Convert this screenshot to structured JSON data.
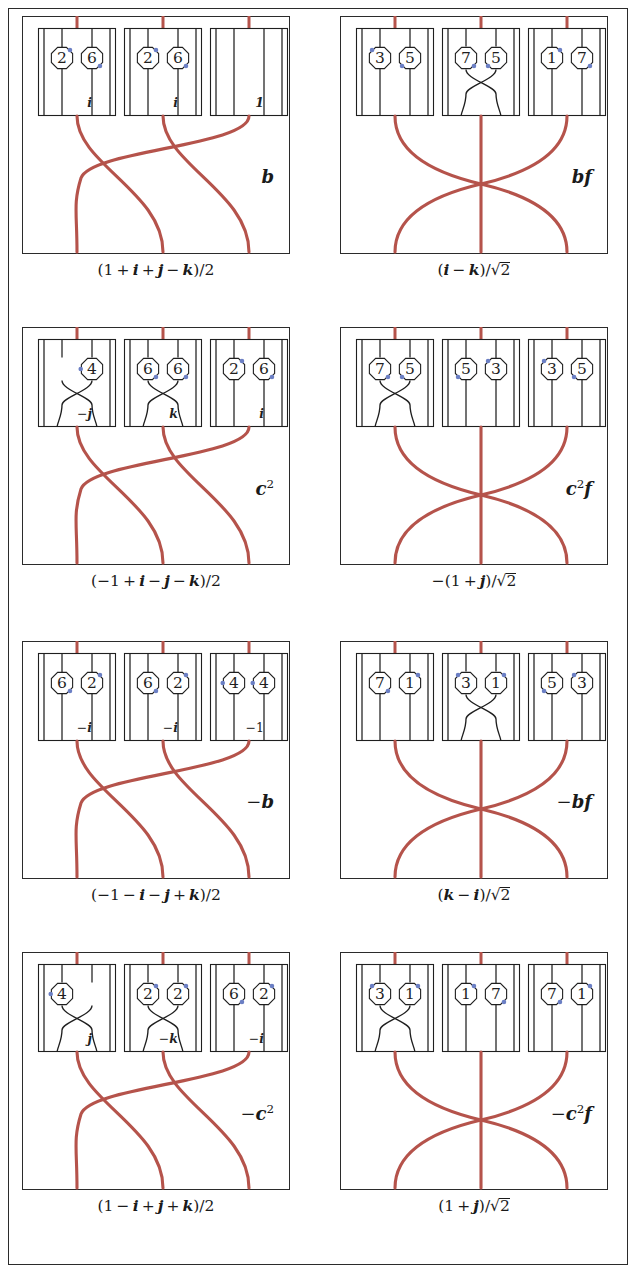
{
  "figure": {
    "type": "braid-diagram-grid",
    "rows": 4,
    "cols": 2,
    "colors": {
      "strand_red": "#b5534b",
      "ink_black": "#1f1f1f",
      "dot_blue": "#6b7fc4",
      "frame": "#2b2b2b",
      "background": "#ffffff"
    },
    "braid_patterns": {
      "left_column": "cyclic-3-strand (1->2, 2->3, 3->1) with two crossings",
      "right_column": "outer-swap (1<->3) crossing at center, middle strand straight"
    }
  },
  "panels": [
    {
      "id": "panel-1",
      "row": 0,
      "col": 0,
      "tag": "b",
      "tag_html": "<span class=\"mi\">b</span>",
      "caption": "(1 + i + j - k)/2",
      "caption_html": "<span class=\"mn\">(1&#8201;+&#8201;</span><span class=\"mi\">i</span><span class=\"mn\">&#8201;+&#8201;</span><span class=\"mi\">j</span><span class=\"mn\">&#8201;&#8722;&#8201;</span><span class=\"mi\">k</span><span class=\"mn\">)/2</span>",
      "braid": "left",
      "cells": [
        {
          "label": "i",
          "crossing": false,
          "nodes": [
            {
              "strand": 0,
              "value": "2",
              "dot": "top-right"
            },
            {
              "strand": 1,
              "value": "6",
              "dot": "bottom-right"
            }
          ]
        },
        {
          "label": "i",
          "crossing": false,
          "nodes": [
            {
              "strand": 0,
              "value": "2",
              "dot": "top-right"
            },
            {
              "strand": 1,
              "value": "6",
              "dot": "bottom-right"
            }
          ]
        },
        {
          "label": "1",
          "crossing": false,
          "nodes": []
        }
      ]
    },
    {
      "id": "panel-2",
      "row": 0,
      "col": 1,
      "tag": "bf",
      "tag_html": "<span class=\"mi\">bf</span>",
      "caption": "(i - k)/√2",
      "caption_html": "<span class=\"mn\">(</span><span class=\"mi\">i</span><span class=\"mn\">&#8201;&#8722;&#8201;</span><span class=\"mi\">k</span><span class=\"mn\">)/</span><span class=\"sqrt-wrap\"><span class=\"sqrt-bar\"></span><span class=\"mn\">&#8730;2</span></span>",
      "braid": "right",
      "cells": [
        {
          "label": "",
          "crossing": false,
          "nodes": [
            {
              "strand": 0,
              "value": "3",
              "dot": "top-left"
            },
            {
              "strand": 1,
              "value": "5",
              "dot": "bottom-left"
            }
          ]
        },
        {
          "label": "",
          "crossing": true,
          "nodes": [
            {
              "strand": 0,
              "value": "7",
              "dot": "bottom-right"
            },
            {
              "strand": 1,
              "value": "5",
              "dot": "bottom-left"
            }
          ]
        },
        {
          "label": "",
          "crossing": false,
          "nodes": [
            {
              "strand": 0,
              "value": "1",
              "dot": "top-right"
            },
            {
              "strand": 1,
              "value": "7",
              "dot": "bottom-right"
            }
          ]
        }
      ]
    },
    {
      "id": "panel-3",
      "row": 1,
      "col": 0,
      "tag": "c²",
      "tag_html": "<span class=\"mi\">c</span><sup class=\"mn\">2</sup>",
      "caption": "(-1 + i - j - k)/2",
      "caption_html": "<span class=\"mn\">(&#8722;1&#8201;+&#8201;</span><span class=\"mi\">i</span><span class=\"mn\">&#8201;&#8722;&#8201;</span><span class=\"mi\">j</span><span class=\"mn\">&#8201;&#8722;&#8201;</span><span class=\"mi\">k</span><span class=\"mn\">)/2</span>",
      "braid": "left",
      "cells": [
        {
          "label": "-j",
          "label_html": "<span class=\"mn\">&#8722;</span><span class=\"mi\">j</span>",
          "crossing": true,
          "nodes": [
            {
              "strand": 1,
              "value": "4",
              "dot": "left"
            }
          ]
        },
        {
          "label": "k",
          "label_html": "<span class=\"mi\">k</span>",
          "crossing": true,
          "nodes": [
            {
              "strand": 0,
              "value": "6",
              "dot": "bottom-right"
            },
            {
              "strand": 1,
              "value": "6",
              "dot": "bottom-right"
            }
          ]
        },
        {
          "label": "i",
          "label_html": "<span class=\"mi\">i</span>",
          "crossing": false,
          "nodes": [
            {
              "strand": 0,
              "value": "2",
              "dot": "top-right"
            },
            {
              "strand": 1,
              "value": "6",
              "dot": "bottom-right"
            }
          ]
        }
      ]
    },
    {
      "id": "panel-4",
      "row": 1,
      "col": 1,
      "tag": "c²f",
      "tag_html": "<span class=\"mi\">c</span><sup class=\"mn\">2</sup><span class=\"mi\">f</span>",
      "caption": "-(1 + j)/√2",
      "caption_html": "<span class=\"mn\">&#8722;(1&#8201;+&#8201;</span><span class=\"mi\">j</span><span class=\"mn\">)/</span><span class=\"sqrt-wrap\"><span class=\"sqrt-bar\"></span><span class=\"mn\">&#8730;2</span></span>",
      "braid": "right",
      "cells": [
        {
          "label": "",
          "crossing": true,
          "nodes": [
            {
              "strand": 0,
              "value": "7",
              "dot": "bottom-right"
            },
            {
              "strand": 1,
              "value": "5",
              "dot": "bottom-left"
            }
          ]
        },
        {
          "label": "",
          "crossing": false,
          "nodes": [
            {
              "strand": 0,
              "value": "5",
              "dot": "bottom-left"
            },
            {
              "strand": 1,
              "value": "3",
              "dot": "top-left"
            }
          ]
        },
        {
          "label": "",
          "crossing": false,
          "nodes": [
            {
              "strand": 0,
              "value": "3",
              "dot": "top-left"
            },
            {
              "strand": 1,
              "value": "5",
              "dot": "bottom-left"
            }
          ]
        }
      ]
    },
    {
      "id": "panel-5",
      "row": 2,
      "col": 0,
      "tag": "-b",
      "tag_html": "<span class=\"mn\">&#8722;</span><span class=\"mi\">b</span>",
      "caption": "(-1 - i - j + k)/2",
      "caption_html": "<span class=\"mn\">(&#8722;1&#8201;&#8722;&#8201;</span><span class=\"mi\">i</span><span class=\"mn\">&#8201;&#8722;&#8201;</span><span class=\"mi\">j</span><span class=\"mn\">&#8201;+&#8201;</span><span class=\"mi\">k</span><span class=\"mn\">)/2</span>",
      "braid": "left",
      "cells": [
        {
          "label": "-i",
          "label_html": "<span class=\"mn\">&#8722;</span><span class=\"mi\">i</span>",
          "crossing": false,
          "nodes": [
            {
              "strand": 0,
              "value": "6",
              "dot": "bottom-right"
            },
            {
              "strand": 1,
              "value": "2",
              "dot": "top-right"
            }
          ]
        },
        {
          "label": "-i",
          "label_html": "<span class=\"mn\">&#8722;</span><span class=\"mi\">i</span>",
          "crossing": false,
          "nodes": [
            {
              "strand": 0,
              "value": "6",
              "dot": "bottom-right"
            },
            {
              "strand": 1,
              "value": "2",
              "dot": "top-right"
            }
          ]
        },
        {
          "label": "-1",
          "label_html": "<span class=\"mn\">&#8722;1</span>",
          "crossing": false,
          "nodes": [
            {
              "strand": 0,
              "value": "4",
              "dot": "left"
            },
            {
              "strand": 1,
              "value": "4",
              "dot": "left"
            }
          ]
        }
      ]
    },
    {
      "id": "panel-6",
      "row": 2,
      "col": 1,
      "tag": "-bf",
      "tag_html": "<span class=\"mn\">&#8722;</span><span class=\"mi\">bf</span>",
      "caption": "(k - i)/√2",
      "caption_html": "<span class=\"mn\">(</span><span class=\"mi\">k</span><span class=\"mn\">&#8201;&#8722;&#8201;</span><span class=\"mi\">i</span><span class=\"mn\">)/</span><span class=\"sqrt-wrap\"><span class=\"sqrt-bar\"></span><span class=\"mn\">&#8730;2</span></span>",
      "braid": "right",
      "cells": [
        {
          "label": "",
          "crossing": false,
          "nodes": [
            {
              "strand": 0,
              "value": "7",
              "dot": "bottom-right"
            },
            {
              "strand": 1,
              "value": "1",
              "dot": "top-right"
            }
          ]
        },
        {
          "label": "",
          "crossing": true,
          "nodes": [
            {
              "strand": 0,
              "value": "3",
              "dot": "top-left"
            },
            {
              "strand": 1,
              "value": "1",
              "dot": "top-right"
            }
          ]
        },
        {
          "label": "",
          "crossing": false,
          "nodes": [
            {
              "strand": 0,
              "value": "5",
              "dot": "bottom-left"
            },
            {
              "strand": 1,
              "value": "3",
              "dot": "top-left"
            }
          ]
        }
      ]
    },
    {
      "id": "panel-7",
      "row": 3,
      "col": 0,
      "tag": "-c²",
      "tag_html": "<span class=\"mn\">&#8722;</span><span class=\"mi\">c</span><sup class=\"mn\">2</sup>",
      "caption": "(1 - i + j + k)/2",
      "caption_html": "<span class=\"mn\">(1&#8201;&#8722;&#8201;</span><span class=\"mi\">i</span><span class=\"mn\">&#8201;+&#8201;</span><span class=\"mi\">j</span><span class=\"mn\">&#8201;+&#8201;</span><span class=\"mi\">k</span><span class=\"mn\">)/2</span>",
      "braid": "left",
      "cells": [
        {
          "label": "j",
          "label_html": "<span class=\"mi\">j</span>",
          "crossing": true,
          "nodes": [
            {
              "strand": 0,
              "value": "4",
              "dot": "left"
            }
          ]
        },
        {
          "label": "-k",
          "label_html": "<span class=\"mn\">&#8722;</span><span class=\"mi\">k</span>",
          "crossing": true,
          "nodes": [
            {
              "strand": 0,
              "value": "2",
              "dot": "top-right"
            },
            {
              "strand": 1,
              "value": "2",
              "dot": "top-right"
            }
          ]
        },
        {
          "label": "-i",
          "label_html": "<span class=\"mn\">&#8722;</span><span class=\"mi\">i</span>",
          "crossing": false,
          "nodes": [
            {
              "strand": 0,
              "value": "6",
              "dot": "bottom-right"
            },
            {
              "strand": 1,
              "value": "2",
              "dot": "top-right"
            }
          ]
        }
      ]
    },
    {
      "id": "panel-8",
      "row": 3,
      "col": 1,
      "tag": "-c²f",
      "tag_html": "<span class=\"mn\">&#8722;</span><span class=\"mi\">c</span><sup class=\"mn\">2</sup><span class=\"mi\">f</span>",
      "caption": "(1 + j)/√2",
      "caption_html": "<span class=\"mn\">(1&#8201;+&#8201;</span><span class=\"mi\">j</span><span class=\"mn\">)/</span><span class=\"sqrt-wrap\"><span class=\"sqrt-bar\"></span><span class=\"mn\">&#8730;2</span></span>",
      "braid": "right",
      "cells": [
        {
          "label": "",
          "crossing": true,
          "nodes": [
            {
              "strand": 0,
              "value": "3",
              "dot": "top-left"
            },
            {
              "strand": 1,
              "value": "1",
              "dot": "top-right"
            }
          ]
        },
        {
          "label": "",
          "crossing": false,
          "nodes": [
            {
              "strand": 0,
              "value": "1",
              "dot": "top-right"
            },
            {
              "strand": 1,
              "value": "7",
              "dot": "bottom-right"
            }
          ]
        },
        {
          "label": "",
          "crossing": false,
          "nodes": [
            {
              "strand": 0,
              "value": "7",
              "dot": "bottom-right"
            },
            {
              "strand": 1,
              "value": "1",
              "dot": "top-right"
            }
          ]
        }
      ]
    }
  ]
}
